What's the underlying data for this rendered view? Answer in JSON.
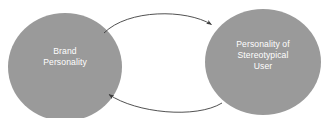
{
  "diagram": {
    "type": "cycle-diagram",
    "background_color": "#ffffff",
    "node_fill_color": "#9a9a9a",
    "node_text_color": "#ffffff",
    "arrow_color": "#3d3d3d",
    "nodes": [
      {
        "id": "brand-personality",
        "label": "Brand\nPersonality",
        "lines": [
          "Brand",
          "Personality"
        ],
        "shape": "ellipse",
        "center_x": 65,
        "center_y": 67,
        "radius_x": 57,
        "radius_y": 54
      },
      {
        "id": "stereotypical-user",
        "label": "Personality of\nStereotypical\nUser",
        "lines": [
          "Personality of",
          "Stereotypical",
          "User"
        ],
        "shape": "ellipse",
        "center_x": 263,
        "center_y": 62,
        "radius_x": 58,
        "radius_y": 53
      }
    ],
    "connectors": [
      {
        "id": "arrow-brand-to-user",
        "from": "brand-personality",
        "to": "stereotypical-user",
        "direction": "left-to-right",
        "style": "curved-arc",
        "arrowhead": "end"
      },
      {
        "id": "arrow-user-to-brand",
        "from": "stereotypical-user",
        "to": "brand-personality",
        "direction": "right-to-left",
        "style": "curved-arc",
        "arrowhead": "end"
      }
    ]
  }
}
